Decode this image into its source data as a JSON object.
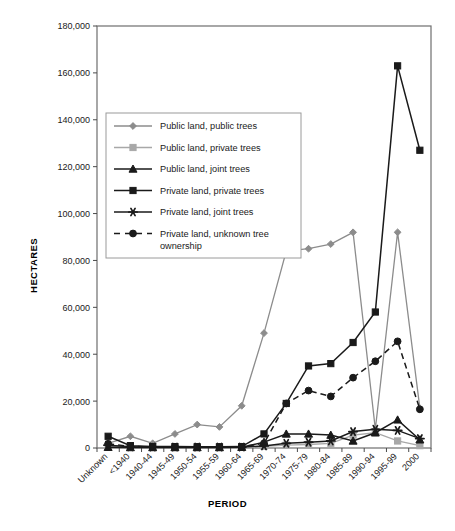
{
  "chart_data": {
    "type": "line",
    "title": "",
    "xlabel": "PERIOD",
    "ylabel": "HECTARES",
    "ylim": [
      0,
      180000
    ],
    "ytick_step": 20000,
    "yticks": [
      "0",
      "20,000",
      "40,000",
      "60,000",
      "80,000",
      "100,000",
      "120,000",
      "140,000",
      "160,000",
      "180,000"
    ],
    "grid": false,
    "legend_position": "upper-left-inside",
    "categories": [
      "Unknown",
      "<1940",
      "1940-44",
      "1945-49",
      "1950-54",
      "1955-59",
      "1960-64",
      "1965-69",
      "1970-74",
      "1975-79",
      "1980-84",
      "1985-89",
      "1990-94",
      "1995-99",
      "2000"
    ],
    "series": [
      {
        "name": "Public land, public trees",
        "marker": "diamond",
        "color": "#8c8c8c",
        "dashed": false,
        "values": [
          2000,
          5000,
          2000,
          6000,
          10000,
          9000,
          18000,
          49000,
          84000,
          85000,
          87000,
          92000,
          8000,
          92000,
          17000
        ]
      },
      {
        "name": "Public land, private trees",
        "marker": "square",
        "color": "#a8a8a8",
        "dashed": false,
        "values": [
          500,
          400,
          300,
          300,
          300,
          300,
          400,
          700,
          1200,
          1500,
          2000,
          5500,
          6500,
          3000,
          1000
        ]
      },
      {
        "name": "Public land, joint trees",
        "marker": "triangle",
        "color": "#1a1a1a",
        "dashed": false,
        "values": [
          300,
          200,
          200,
          200,
          200,
          200,
          300,
          2500,
          6000,
          6000,
          5500,
          3000,
          6500,
          12000,
          3500
        ]
      },
      {
        "name": "Private land, private trees",
        "marker": "square",
        "color": "#1a1a1a",
        "dashed": false,
        "values": [
          5000,
          1000,
          600,
          600,
          500,
          500,
          600,
          6000,
          19000,
          35000,
          36000,
          45000,
          58000,
          163000,
          127000
        ]
      },
      {
        "name": "Private land, joint trees",
        "marker": "star",
        "color": "#1a1a1a",
        "dashed": false,
        "values": [
          1200,
          500,
          400,
          400,
          400,
          400,
          400,
          900,
          2000,
          2500,
          3000,
          7000,
          8000,
          7500,
          4000
        ]
      },
      {
        "name": "Private land, unknown tree ownership",
        "marker": "circle",
        "color": "#1a1a1a",
        "dashed": true,
        "values": [
          1800,
          700,
          500,
          500,
          400,
          400,
          500,
          2000,
          19000,
          24500,
          22000,
          30000,
          37000,
          45500,
          16500
        ]
      }
    ]
  },
  "legend": {
    "items": [
      {
        "label": "Public land, public trees"
      },
      {
        "label": "Public land, private trees"
      },
      {
        "label": "Public land, joint trees"
      },
      {
        "label": "Private land, private trees"
      },
      {
        "label": "Private land, joint trees"
      },
      {
        "label": "Private land, unknown tree ownership"
      }
    ]
  },
  "axes": {
    "y_title": "HECTARES",
    "x_title": "PERIOD"
  },
  "colors": {
    "grey_light": "#a8a8a8",
    "grey_mid": "#8c8c8c",
    "black": "#1a1a1a",
    "frame": "#6e6e6e"
  }
}
